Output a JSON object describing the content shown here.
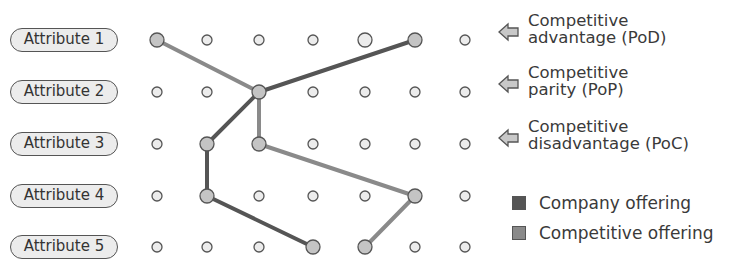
{
  "attributes": [
    {
      "label": "Attribute 1"
    },
    {
      "label": "Attribute 2"
    },
    {
      "label": "Attribute 3"
    },
    {
      "label": "Attribute 4"
    },
    {
      "label": "Attribute 5"
    }
  ],
  "grid": {
    "columns_x": [
      157,
      207,
      259,
      313,
      365,
      415,
      465
    ],
    "rows_y": [
      40,
      92,
      144,
      196,
      247
    ]
  },
  "legend": {
    "positions": [
      {
        "line1": "Competitive",
        "line2": "advantage (PoD)"
      },
      {
        "line1": "Competitive",
        "line2": "parity (PoP)"
      },
      {
        "line1": "Competitive",
        "line2": "disadvantage (PoC)"
      }
    ],
    "series": [
      {
        "label": "Company offering",
        "color": "#555555"
      },
      {
        "label": "Competitive offering",
        "color": "#8a8a8a"
      }
    ]
  },
  "chart_data": {
    "type": "line",
    "title": "",
    "categories": [
      "Attribute 1",
      "Attribute 2",
      "Attribute 3",
      "Attribute 4",
      "Attribute 5"
    ],
    "scale_positions": 7,
    "series": [
      {
        "name": "Company offering",
        "color": "#555555",
        "values": [
          6,
          3,
          2,
          2,
          4
        ]
      },
      {
        "name": "Competitive offering",
        "color": "#8a8a8a",
        "values": [
          1,
          3,
          3,
          6,
          5
        ]
      }
    ],
    "annotations": [
      "Competitive advantage (PoD)",
      "Competitive parity (PoP)",
      "Competitive disadvantage (PoC)"
    ]
  }
}
